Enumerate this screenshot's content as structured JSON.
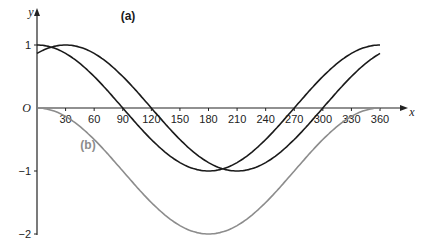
{
  "chart_data": {
    "type": "line",
    "title": "",
    "xlabel": "x",
    "ylabel": "y",
    "origin_label": "O",
    "xlim": [
      0,
      360
    ],
    "ylim": [
      -2,
      1
    ],
    "grid": false,
    "x_ticks": [
      30,
      60,
      90,
      120,
      150,
      180,
      210,
      240,
      270,
      300,
      330,
      360
    ],
    "y_ticks": [
      1,
      -1,
      -2
    ],
    "series": [
      {
        "name": "(a)",
        "label": "(a)",
        "expression": "y = cos(x - 30)",
        "color": "#1a1a1a",
        "x": [
          0,
          30,
          60,
          90,
          120,
          150,
          180,
          210,
          240,
          270,
          300,
          330,
          360
        ],
        "values": [
          0.87,
          1,
          0.87,
          0.5,
          0,
          -0.5,
          -0.87,
          -1,
          -0.87,
          -0.5,
          0,
          0.5,
          0.87
        ]
      },
      {
        "name": "cos x",
        "label": "",
        "expression": "y = cos x",
        "color": "#1a1a1a",
        "x": [
          0,
          30,
          60,
          90,
          120,
          150,
          180,
          210,
          240,
          270,
          300,
          330,
          360
        ],
        "values": [
          1,
          0.87,
          0.5,
          0,
          -0.5,
          -0.87,
          -1,
          -0.87,
          -0.5,
          0,
          0.5,
          0.87,
          1
        ]
      },
      {
        "name": "(b)",
        "label": "(b)",
        "expression": "y = cos x - 1",
        "color": "#8c8c8c",
        "x": [
          0,
          30,
          60,
          90,
          120,
          150,
          180,
          210,
          240,
          270,
          300,
          330,
          360
        ],
        "values": [
          0,
          -0.13,
          -0.5,
          -1,
          -1.5,
          -1.87,
          -2,
          -1.87,
          -1.5,
          -1,
          -0.5,
          -0.13,
          0
        ]
      }
    ],
    "annotations": [
      {
        "text": "(a)",
        "near": "top, x≈130"
      },
      {
        "text": "(b)",
        "near": "x≈55, y≈-0.55"
      }
    ]
  }
}
